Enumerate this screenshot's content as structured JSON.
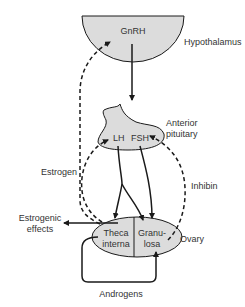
{
  "diagram": {
    "colors": {
      "organ_fill": "#dcdcdc",
      "stroke": "#1a1a1a",
      "text": "#333333",
      "background": "#ffffff"
    },
    "nodes": {
      "hypothalamus": {
        "label": "Hypothalamus",
        "hormone": "GnRH"
      },
      "pituitary": {
        "label_line1": "Anterior",
        "label_line2": "pituitary",
        "hormone_left": "LH",
        "hormone_right": "FSH"
      },
      "ovary": {
        "label": "Ovary",
        "left_cell_line1": "Theca",
        "left_cell_line2": "interna",
        "right_cell_line1": "Granu-",
        "right_cell_line2": "losa"
      }
    },
    "edge_labels": {
      "estrogen": "Estrogen",
      "inhibin": "Inhibin",
      "estrogenic_effects_line1": "Estrogenic",
      "estrogenic_effects_line2": "effects",
      "androgens": "Androgens"
    },
    "edges": [
      {
        "from": "hypothalamus",
        "to": "pituitary",
        "label": "GnRH",
        "style": "solid"
      },
      {
        "from": "pituitary",
        "to": "theca interna",
        "label": "LH",
        "style": "solid"
      },
      {
        "from": "pituitary",
        "to": "granulosa",
        "label": "LH",
        "style": "solid"
      },
      {
        "from": "pituitary",
        "to": "granulosa",
        "label": "FSH",
        "style": "solid"
      },
      {
        "from": "ovary",
        "to": "hypothalamus",
        "label": "Estrogen",
        "style": "dashed"
      },
      {
        "from": "ovary",
        "to": "pituitary",
        "label": "Estrogen",
        "style": "dashed"
      },
      {
        "from": "granulosa",
        "to": "pituitary",
        "label": "Inhibin",
        "style": "dashed"
      },
      {
        "from": "theca interna",
        "to": "granulosa",
        "label": "Androgens",
        "style": "solid"
      },
      {
        "from": "ovary",
        "to": "estrogenic effects",
        "label": "",
        "style": "solid"
      }
    ]
  }
}
